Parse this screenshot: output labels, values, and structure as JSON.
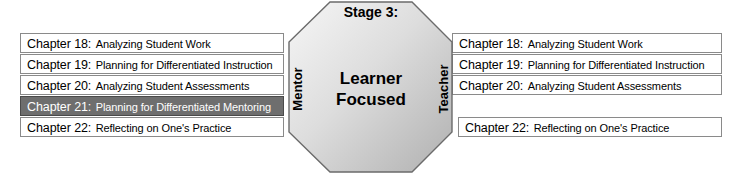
{
  "diagram": {
    "title": "Stage 3: Learner Focused",
    "center": {
      "stage_label": "Stage 3:",
      "focus_line_1": "Learner",
      "focus_line_2": "Focused",
      "left_side_label": "Mentor",
      "right_side_label": "Teacher"
    },
    "colors": {
      "octagon_fill_light": "#f2f2f2",
      "octagon_fill_dark": "#b4b4b4",
      "octagon_stroke": "#6b6b6b",
      "box_stroke": "#8a8a8a",
      "box_fill": "#ffffff",
      "highlight_fill": "#6e6e6e",
      "highlight_text": "#ffffff",
      "text": "#000000"
    },
    "left_column": {
      "heading_role": "Mentor",
      "rows": [
        {
          "number": "Chapter 18:",
          "title": "Analyzing Student Work",
          "highlighted": false
        },
        {
          "number": "Chapter 19:",
          "title": "Planning for Differentiated Instruction",
          "highlighted": false
        },
        {
          "number": "Chapter 20:",
          "title": "Analyzing Student Assessments",
          "highlighted": false
        },
        {
          "number": "Chapter 21:",
          "title": "Planning for Differentiated Mentoring",
          "highlighted": true
        },
        {
          "number": "Chapter 22:",
          "title": "Reflecting on One's Practice",
          "highlighted": false
        }
      ]
    },
    "right_column": {
      "heading_role": "Teacher",
      "rows": [
        {
          "number": "Chapter 18:",
          "title": "Analyzing Student Work",
          "highlighted": false
        },
        {
          "number": "Chapter 19:",
          "title": "Planning for Differentiated Instruction",
          "highlighted": false
        },
        {
          "number": "Chapter 20:",
          "title": "Analyzing Student Assessments",
          "highlighted": false
        },
        {
          "number": "",
          "title": "",
          "highlighted": false,
          "empty": true
        },
        {
          "number": "Chapter 22:",
          "title": "Reflecting on One's Practice",
          "highlighted": false
        }
      ]
    }
  }
}
